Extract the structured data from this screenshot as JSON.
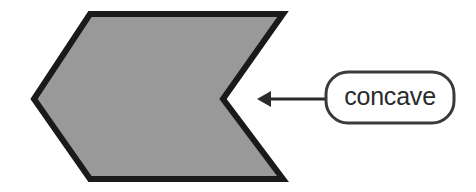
{
  "figure": {
    "background_color": "#ffffff",
    "shape": {
      "name": "concave-hexagon",
      "fill_color": "#999999",
      "stroke_color": "#1a1a1a",
      "stroke_width": 6,
      "points": "34,99 90,14 283,14 223,99 283,179 90,179"
    },
    "annotation": {
      "label": "concave",
      "label_box": {
        "x": 326,
        "y": 72,
        "width": 128,
        "height": 51,
        "corner_radius": 22,
        "fill_color": "#ffffff",
        "stroke_color": "#3a3a3a",
        "stroke_width": 3
      },
      "arrow": {
        "name": "leader-arrow",
        "color": "#2b2b2b",
        "stroke_width": 3,
        "tip_x": 257,
        "tip_y": 99,
        "tail_x": 326,
        "tail_y": 99,
        "head_length": 14,
        "head_half_width": 8
      }
    }
  }
}
